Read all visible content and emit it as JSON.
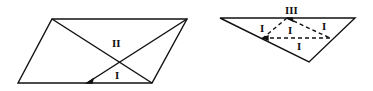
{
  "figures": [
    {
      "name": "parallelogram",
      "labels": [
        "II",
        "I"
      ]
    },
    {
      "name": "triangle",
      "labels": [
        "III",
        "I",
        "I",
        "I",
        "I"
      ]
    }
  ],
  "colors": {
    "stroke": "#111111",
    "background": "#ffffff"
  }
}
